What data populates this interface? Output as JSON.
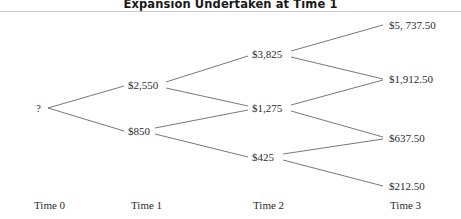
{
  "title": "Expansion Undertaken at Time 1",
  "colors": {
    "background": "#ffffff",
    "rule": "#c9c9c9",
    "branch": "#555555",
    "text": "#2b2b2b",
    "title_text": "#1a1a1a"
  },
  "axis": {
    "labels": [
      {
        "text": "Time 0",
        "x": 34
      },
      {
        "text": "Time 1",
        "x": 131
      },
      {
        "text": "Time 2",
        "x": 253
      },
      {
        "text": "Time 3",
        "x": 390
      }
    ]
  },
  "chart_data": {
    "type": "diagram",
    "subtype": "binomial-lattice-tree",
    "title": "Expansion Undertaken at Time 1",
    "xlabel": "",
    "ylabel": "",
    "stages": [
      "Time 0",
      "Time 1",
      "Time 2",
      "Time 3"
    ],
    "nodes": [
      {
        "id": "n0",
        "stage": 0,
        "label": "?",
        "value": null,
        "x": 36,
        "y": 108
      },
      {
        "id": "n1u",
        "stage": 1,
        "label": "$2,550",
        "value": 2550,
        "x": 128,
        "y": 85
      },
      {
        "id": "n1d",
        "stage": 1,
        "label": "$850",
        "value": 850,
        "x": 128,
        "y": 131
      },
      {
        "id": "n2u",
        "stage": 2,
        "label": "$3,825",
        "value": 3825,
        "x": 252,
        "y": 54
      },
      {
        "id": "n2m",
        "stage": 2,
        "label": "$1,275",
        "value": 1275,
        "x": 252,
        "y": 108
      },
      {
        "id": "n2d",
        "stage": 2,
        "label": "$425",
        "value": 425,
        "x": 252,
        "y": 157
      },
      {
        "id": "n3a",
        "stage": 3,
        "label": "$5, 737.50",
        "value": 5737.5,
        "x": 389,
        "y": 25
      },
      {
        "id": "n3b",
        "stage": 3,
        "label": "$1,912.50",
        "value": 1912.5,
        "x": 389,
        "y": 79
      },
      {
        "id": "n3c",
        "stage": 3,
        "label": "$637.50",
        "value": 637.5,
        "x": 389,
        "y": 138
      },
      {
        "id": "n3d",
        "stage": 3,
        "label": "$212.50",
        "value": 212.5,
        "x": 389,
        "y": 186
      }
    ],
    "edges": [
      {
        "from": "n0",
        "to": "n1u",
        "x1": 48,
        "y1": 108,
        "x2": 124,
        "y2": 86
      },
      {
        "from": "n0",
        "to": "n1d",
        "x1": 48,
        "y1": 108,
        "x2": 124,
        "y2": 131
      },
      {
        "from": "n1u",
        "to": "n2u",
        "x1": 166,
        "y1": 82,
        "x2": 248,
        "y2": 56
      },
      {
        "from": "n1u",
        "to": "n2m",
        "x1": 166,
        "y1": 88,
        "x2": 248,
        "y2": 106
      },
      {
        "from": "n1d",
        "to": "n2m",
        "x1": 155,
        "y1": 128,
        "x2": 248,
        "y2": 110
      },
      {
        "from": "n1d",
        "to": "n2d",
        "x1": 155,
        "y1": 134,
        "x2": 248,
        "y2": 157
      },
      {
        "from": "n2u",
        "to": "n3a",
        "x1": 291,
        "y1": 51,
        "x2": 383,
        "y2": 25
      },
      {
        "from": "n2u",
        "to": "n3b",
        "x1": 291,
        "y1": 57,
        "x2": 383,
        "y2": 79
      },
      {
        "from": "n2m",
        "to": "n3b",
        "x1": 291,
        "y1": 105,
        "x2": 383,
        "y2": 80
      },
      {
        "from": "n2m",
        "to": "n3c",
        "x1": 291,
        "y1": 111,
        "x2": 383,
        "y2": 137
      },
      {
        "from": "n2d",
        "to": "n3c",
        "x1": 283,
        "y1": 154,
        "x2": 383,
        "y2": 139
      },
      {
        "from": "n2d",
        "to": "n3d",
        "x1": 283,
        "y1": 160,
        "x2": 383,
        "y2": 186
      }
    ]
  }
}
